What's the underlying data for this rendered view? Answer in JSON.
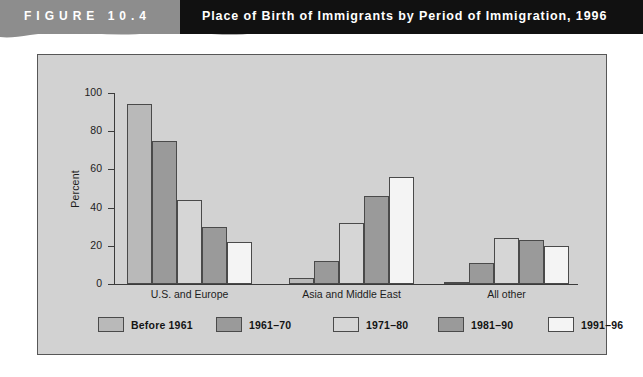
{
  "header": {
    "figure_label": "FIGURE 10.4",
    "title": "Place of Birth of Immigrants by Period of Immigration, 1996",
    "banner_gray": "#8d8d8d",
    "banner_black": "#111111"
  },
  "panel": {
    "background": "#d2d2d2",
    "border_color": "#575757"
  },
  "chart_data": {
    "type": "bar",
    "title": "Place of Birth of Immigrants by Period of Immigration, 1996",
    "xlabel": "",
    "ylabel": "Percent",
    "ylim": [
      0,
      100
    ],
    "yticks": [
      0,
      20,
      40,
      60,
      80,
      100
    ],
    "grid": false,
    "legend_position": "bottom",
    "categories": [
      "U.S. and Europe",
      "Asia and Middle East",
      "All other"
    ],
    "series": [
      {
        "name": "Before 1961",
        "color": "#b9b9b9",
        "values": [
          94,
          3,
          1
        ]
      },
      {
        "name": "1961–70",
        "color": "#9a9a9a",
        "values": [
          75,
          12,
          11
        ]
      },
      {
        "name": "1971–80",
        "color": "#d6d6d6",
        "values": [
          44,
          32,
          24
        ]
      },
      {
        "name": "1981–90",
        "color": "#9a9a9a",
        "values": [
          30,
          46,
          23
        ]
      },
      {
        "name": "1991–96",
        "color": "#f4f4f4",
        "values": [
          22,
          56,
          20
        ]
      }
    ]
  }
}
